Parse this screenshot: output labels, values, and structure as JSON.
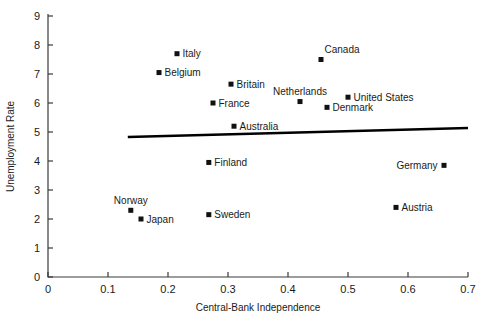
{
  "chart_data": {
    "type": "scatter",
    "title": "",
    "xlabel": "Central-Bank Independence",
    "ylabel": "Unemployment Rate",
    "xlim": [
      0,
      0.7
    ],
    "ylim": [
      0,
      9
    ],
    "xticks": [
      "0",
      "0.1",
      "0.2",
      "0.3",
      "0.4",
      "0.5",
      "0.6",
      "0.7"
    ],
    "xtick_values": [
      0,
      0.1,
      0.2,
      0.3,
      0.4,
      0.5,
      0.6,
      0.7
    ],
    "yticks": [
      "0",
      "1",
      "2",
      "3",
      "4",
      "5",
      "6",
      "7",
      "8",
      "9"
    ],
    "ytick_values": [
      0,
      1,
      2,
      3,
      4,
      5,
      6,
      7,
      8,
      9
    ],
    "grid": false,
    "legend": "none",
    "points": [
      {
        "label": "Italy",
        "x": 0.215,
        "y": 7.7,
        "label_side": "right"
      },
      {
        "label": "Belgium",
        "x": 0.185,
        "y": 7.05,
        "label_side": "right"
      },
      {
        "label": "Britain",
        "x": 0.305,
        "y": 6.65,
        "label_side": "right"
      },
      {
        "label": "Canada",
        "x": 0.455,
        "y": 7.5,
        "label_side": "above-right"
      },
      {
        "label": "Netherlands",
        "x": 0.42,
        "y": 6.05,
        "label_side": "above"
      },
      {
        "label": "United States",
        "x": 0.5,
        "y": 6.2,
        "label_side": "right"
      },
      {
        "label": "Denmark",
        "x": 0.465,
        "y": 5.85,
        "label_side": "right"
      },
      {
        "label": "France",
        "x": 0.275,
        "y": 6.0,
        "label_side": "right"
      },
      {
        "label": "Australia",
        "x": 0.31,
        "y": 5.2,
        "label_side": "right"
      },
      {
        "label": "Finland",
        "x": 0.268,
        "y": 3.95,
        "label_side": "right"
      },
      {
        "label": "Germany",
        "x": 0.66,
        "y": 3.85,
        "label_side": "left"
      },
      {
        "label": "Norway",
        "x": 0.138,
        "y": 2.3,
        "label_side": "above"
      },
      {
        "label": "Japan",
        "x": 0.155,
        "y": 2.0,
        "label_side": "right"
      },
      {
        "label": "Sweden",
        "x": 0.268,
        "y": 2.15,
        "label_side": "right"
      },
      {
        "label": "Austria",
        "x": 0.58,
        "y": 2.4,
        "label_side": "right"
      }
    ],
    "trendline": {
      "x_start": 0.133,
      "y_start": 4.83,
      "x_end": 0.7,
      "y_end": 5.14,
      "description": "fitted regression line, slightly upward sloping"
    }
  },
  "colors": {
    "marker": "#111111",
    "axis": "#3a3a3a",
    "trendline": "#000000",
    "background": "#ffffff"
  }
}
